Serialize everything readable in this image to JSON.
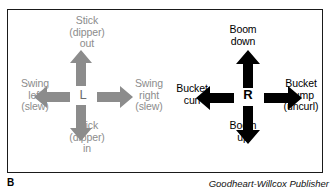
{
  "figure": {
    "part_label": "B",
    "credit": "Goodheart-Willcox Publisher"
  },
  "left_joystick": {
    "center_letter": "L",
    "color": "#8c8c8c",
    "up": {
      "line1": "Stick",
      "line2": "(dipper)",
      "line3": "out"
    },
    "down": {
      "line1": "Stick",
      "line2": "(dipper)",
      "line3": "in"
    },
    "left": {
      "line1": "Swing",
      "line2": "left",
      "line3": "(slew)"
    },
    "right": {
      "line1": "Swing",
      "line2": "right",
      "line3": "(slew)"
    }
  },
  "right_joystick": {
    "center_letter": "R",
    "color": "#000000",
    "up": {
      "line1": "Boom",
      "line2": "down",
      "line3": ""
    },
    "down": {
      "line1": "Boom",
      "line2": "up",
      "line3": ""
    },
    "left": {
      "line1": "Bucket",
      "line2": "curl",
      "line3": ""
    },
    "right": {
      "line1": "Bucket",
      "line2": "dump",
      "line3": "(uncurl)"
    }
  }
}
